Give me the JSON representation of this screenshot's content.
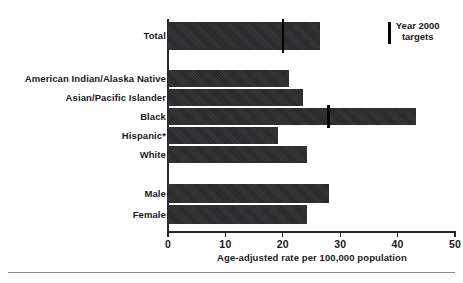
{
  "figure": {
    "title_remnant": "",
    "footnote_rule": true
  },
  "legend": {
    "swatch_name": "target-tick-marker",
    "line1": "Year 2000",
    "line2": "targets"
  },
  "axis": {
    "x_title": "Age-adjusted rate per 100,000 population",
    "x_ticks": [
      "0",
      "10",
      "20",
      "30",
      "40",
      "50"
    ]
  },
  "chart_data": {
    "type": "bar",
    "orientation": "horizontal",
    "title": "",
    "xlabel": "Age-adjusted rate per 100,000 population",
    "ylabel": "",
    "xlim": [
      0,
      50
    ],
    "xticks": [
      0,
      10,
      20,
      30,
      40,
      50
    ],
    "grid": false,
    "legend_position": "top-right",
    "legend_entries": [
      "Year 2000 targets"
    ],
    "bar_color": "#2b2b2d",
    "target_color": "#000000",
    "groups": [
      {
        "name": "Total",
        "categories": [
          "Total"
        ],
        "values": [
          26.5
        ],
        "targets": [
          20
        ]
      },
      {
        "name": "Race/Ethnicity",
        "categories": [
          "American Indian/Alaska Native",
          "Asian/Pacific Islander",
          "Black",
          "Hispanic*",
          "White"
        ],
        "values": [
          21.0,
          23.5,
          43.2,
          19.2,
          24.2
        ],
        "targets": [
          null,
          null,
          28,
          null,
          null
        ]
      },
      {
        "name": "Sex",
        "categories": [
          "Male",
          "Female"
        ],
        "values": [
          28.0,
          24.2
        ],
        "targets": [
          null,
          null
        ]
      }
    ],
    "categories": [
      "Total",
      "American Indian/Alaska Native",
      "Asian/Pacific Islander",
      "Black",
      "Hispanic*",
      "White",
      "Male",
      "Female"
    ],
    "values": [
      26.5,
      21.0,
      23.5,
      43.2,
      19.2,
      24.2,
      28.0,
      24.2
    ],
    "targets": [
      20,
      null,
      null,
      28,
      null,
      null,
      null,
      null
    ]
  },
  "bars": [
    {
      "label": "Total",
      "top": 22,
      "height": 28,
      "value": 26.5,
      "target": 20
    },
    {
      "label": "American Indian/Alaska Native",
      "top": 70,
      "height": 17,
      "value": 21.0,
      "target": null
    },
    {
      "label": "Asian/Pacific Islander",
      "top": 89,
      "height": 17,
      "value": 23.5,
      "target": null
    },
    {
      "label": "Black",
      "top": 108,
      "height": 17,
      "value": 43.2,
      "target": 28
    },
    {
      "label": "Hispanic*",
      "top": 127,
      "height": 17,
      "value": 19.2,
      "target": null
    },
    {
      "label": "White",
      "top": 146,
      "height": 17,
      "value": 24.2,
      "target": null
    },
    {
      "label": "Male",
      "top": 184,
      "height": 19,
      "value": 28.0,
      "target": null
    },
    {
      "label": "Female",
      "top": 205,
      "height": 19,
      "value": 24.2,
      "target": null
    }
  ]
}
